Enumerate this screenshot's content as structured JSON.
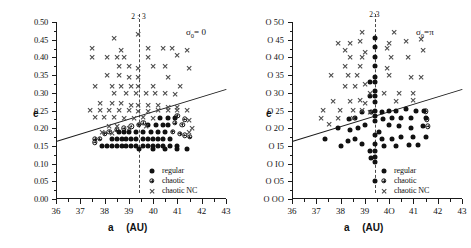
{
  "figure": {
    "panels": [
      {
        "id": "left",
        "annotation": "σ",
        "annotation_sub": "0",
        "annotation_eq": "= 0",
        "resonance_label": "2 : 3",
        "resonance_a": 39.4,
        "xlabel_a": "a",
        "xlabel_unit": "(AU)",
        "ylabel": "e",
        "zero_style": "digit",
        "xticks": [
          "36",
          "37",
          "38",
          "39",
          "40",
          "41",
          "42",
          "43"
        ],
        "yticks": [
          "0.50",
          "0.45",
          "0.40",
          "0.35",
          "0.30",
          "0.25",
          "0.20",
          "0.15",
          "0.10",
          "0.05",
          "0.00"
        ],
        "legend": [
          {
            "marker": "regular",
            "label": "regular"
          },
          {
            "marker": "chaotic",
            "label": "chaotic"
          },
          {
            "marker": "cross",
            "label": "chaotic NC"
          }
        ]
      },
      {
        "id": "right",
        "annotation": "σ",
        "annotation_sub": "0",
        "annotation_eq": "=π",
        "resonance_label": "2:3",
        "resonance_a": 39.4,
        "xlabel_a": "a",
        "xlabel_unit": "(AU)",
        "ylabel": "e",
        "zero_style": "circle",
        "xticks": [
          "36",
          "37",
          "38",
          "39",
          "4O",
          "41",
          "42",
          "43"
        ],
        "yticks": [
          "O 5O",
          "O 45",
          "O 4O",
          "O 35",
          "O 3O",
          "O 25",
          "O 2O",
          "O I5",
          "O IO",
          "O O5",
          "O OO"
        ],
        "legend": [
          {
            "marker": "regular",
            "label": "regular"
          },
          {
            "marker": "chaotic",
            "label": "chaotic"
          },
          {
            "marker": "cross",
            "label": "chaotic NC"
          }
        ]
      }
    ]
  },
  "chart_data": {
    "type": "scatter",
    "title": "",
    "xlabel": "a  (AU)",
    "ylabel": "e",
    "xlim": [
      36,
      43
    ],
    "ylim": [
      0.0,
      0.5
    ],
    "xtick_step": 1,
    "xminor_step": 0.5,
    "ytick_step": 0.05,
    "grid": false,
    "legend_position": "bottom-right",
    "legend_entries": [
      "regular",
      "chaotic",
      "chaotic NC"
    ],
    "annotations": [
      {
        "text": "2 : 3",
        "panel": "left",
        "x": 39.4,
        "y": 0.5
      },
      {
        "text": "σ₀ = 0",
        "panel": "left",
        "x": 42.4,
        "y": 0.465
      },
      {
        "text": "2:3",
        "panel": "right",
        "x": 39.4,
        "y": 0.5
      },
      {
        "text": "σ₀ = π",
        "panel": "right",
        "x": 42.4,
        "y": 0.465
      }
    ],
    "reference_lines": [
      {
        "name": "resonance-2-3",
        "panel": "left",
        "type": "vertical-dashed",
        "x": 39.4
      },
      {
        "name": "resonance-2-3",
        "panel": "right",
        "type": "vertical-dashed",
        "x": 39.4
      },
      {
        "name": "perihelion-boundary",
        "panel": "left",
        "type": "line",
        "x0": 36,
        "y0": 0.165,
        "x1": 43,
        "y1": 0.312
      },
      {
        "name": "perihelion-boundary",
        "panel": "right",
        "type": "line",
        "x0": 36,
        "y0": 0.165,
        "x1": 43,
        "y1": 0.312
      }
    ],
    "series": [
      {
        "name": "regular",
        "panel": "left",
        "marker": "filled-circle",
        "points": [
          [
            37.9,
            0.15
          ],
          [
            38.1,
            0.15
          ],
          [
            38.3,
            0.15
          ],
          [
            38.5,
            0.15
          ],
          [
            38.7,
            0.15
          ],
          [
            38.9,
            0.15
          ],
          [
            39.1,
            0.15
          ],
          [
            39.3,
            0.15
          ],
          [
            39.6,
            0.15
          ],
          [
            39.8,
            0.15
          ],
          [
            40.0,
            0.15
          ],
          [
            40.2,
            0.15
          ],
          [
            40.4,
            0.15
          ],
          [
            40.7,
            0.15
          ],
          [
            41.0,
            0.15
          ],
          [
            41.4,
            0.14
          ],
          [
            39.4,
            0.14
          ],
          [
            40.0,
            0.14
          ],
          [
            40.5,
            0.14
          ],
          [
            41.0,
            0.14
          ],
          [
            38.3,
            0.17
          ],
          [
            38.5,
            0.17
          ],
          [
            38.7,
            0.17
          ],
          [
            38.9,
            0.17
          ],
          [
            39.1,
            0.17
          ],
          [
            39.3,
            0.17
          ],
          [
            39.6,
            0.17
          ],
          [
            39.8,
            0.17
          ],
          [
            40.0,
            0.17
          ],
          [
            40.2,
            0.17
          ],
          [
            40.4,
            0.17
          ],
          [
            40.7,
            0.17
          ],
          [
            38.6,
            0.19
          ],
          [
            38.8,
            0.19
          ],
          [
            39.0,
            0.19
          ],
          [
            39.3,
            0.19
          ],
          [
            39.6,
            0.19
          ],
          [
            39.9,
            0.19
          ],
          [
            40.2,
            0.19
          ],
          [
            40.5,
            0.19
          ],
          [
            39.8,
            0.21
          ],
          [
            40.1,
            0.21
          ],
          [
            40.4,
            0.21
          ],
          [
            40.6,
            0.21
          ],
          [
            40.3,
            0.23
          ],
          [
            40.6,
            0.23
          ],
          [
            40.9,
            0.23
          ]
        ]
      },
      {
        "name": "chaotic",
        "panel": "left",
        "marker": "circled-plus",
        "points": [
          [
            37.6,
            0.16
          ],
          [
            37.6,
            0.17
          ],
          [
            37.8,
            0.17
          ],
          [
            38.0,
            0.185
          ],
          [
            38.2,
            0.19
          ],
          [
            38.5,
            0.195
          ],
          [
            38.8,
            0.2
          ],
          [
            39.1,
            0.205
          ],
          [
            39.4,
            0.21
          ],
          [
            40.8,
            0.19
          ],
          [
            41.1,
            0.185
          ],
          [
            41.3,
            0.18
          ],
          [
            41.5,
            0.175
          ],
          [
            40.9,
            0.215
          ],
          [
            41.2,
            0.21
          ],
          [
            41.0,
            0.235
          ],
          [
            41.3,
            0.225
          ],
          [
            39.6,
            0.215
          ]
        ]
      },
      {
        "name": "chaotic NC",
        "panel": "left",
        "marker": "cross",
        "points": [
          [
            39.4,
            0.465
          ],
          [
            38.4,
            0.455
          ],
          [
            37.5,
            0.425
          ],
          [
            38.7,
            0.42
          ],
          [
            39.8,
            0.425
          ],
          [
            40.4,
            0.425
          ],
          [
            40.8,
            0.425
          ],
          [
            41.4,
            0.42
          ],
          [
            37.5,
            0.4
          ],
          [
            38.1,
            0.4
          ],
          [
            38.5,
            0.4
          ],
          [
            38.8,
            0.4
          ],
          [
            39.8,
            0.4
          ],
          [
            41.0,
            0.405
          ],
          [
            38.6,
            0.375
          ],
          [
            39.0,
            0.375
          ],
          [
            39.4,
            0.37
          ],
          [
            40.0,
            0.375
          ],
          [
            40.5,
            0.375
          ],
          [
            41.5,
            0.37
          ],
          [
            38.1,
            0.35
          ],
          [
            38.6,
            0.35
          ],
          [
            39.0,
            0.345
          ],
          [
            39.4,
            0.345
          ],
          [
            40.6,
            0.345
          ],
          [
            37.6,
            0.32
          ],
          [
            38.3,
            0.32
          ],
          [
            38.7,
            0.32
          ],
          [
            39.1,
            0.32
          ],
          [
            39.4,
            0.32
          ],
          [
            40.0,
            0.32
          ],
          [
            41.1,
            0.32
          ],
          [
            38.4,
            0.3
          ],
          [
            38.9,
            0.3
          ],
          [
            39.3,
            0.3
          ],
          [
            39.7,
            0.3
          ],
          [
            40.1,
            0.3
          ],
          [
            40.5,
            0.3
          ],
          [
            40.9,
            0.295
          ],
          [
            37.8,
            0.27
          ],
          [
            38.3,
            0.27
          ],
          [
            38.7,
            0.27
          ],
          [
            39.1,
            0.265
          ],
          [
            39.4,
            0.265
          ],
          [
            39.8,
            0.265
          ],
          [
            40.2,
            0.265
          ],
          [
            40.6,
            0.26
          ],
          [
            41.0,
            0.26
          ],
          [
            37.4,
            0.25
          ],
          [
            37.8,
            0.25
          ],
          [
            38.2,
            0.25
          ],
          [
            38.6,
            0.25
          ],
          [
            39.0,
            0.25
          ],
          [
            39.4,
            0.248
          ],
          [
            39.8,
            0.248
          ],
          [
            40.2,
            0.25
          ],
          [
            40.6,
            0.25
          ],
          [
            41.0,
            0.25
          ],
          [
            41.4,
            0.25
          ],
          [
            37.6,
            0.23
          ],
          [
            38.0,
            0.23
          ],
          [
            38.4,
            0.23
          ],
          [
            38.8,
            0.228
          ],
          [
            39.2,
            0.228
          ],
          [
            39.6,
            0.23
          ],
          [
            40.0,
            0.228
          ],
          [
            41.5,
            0.222
          ],
          [
            38.2,
            0.205
          ],
          [
            38.5,
            0.205
          ],
          [
            39.0,
            0.2
          ],
          [
            39.7,
            0.205
          ],
          [
            41.6,
            0.2
          ],
          [
            37.9,
            0.188
          ],
          [
            38.3,
            0.185
          ],
          [
            41.5,
            0.19
          ]
        ]
      },
      {
        "name": "regular",
        "panel": "right",
        "marker": "filled-circle",
        "points": [
          [
            39.4,
            0.455
          ],
          [
            39.4,
            0.43
          ],
          [
            39.4,
            0.4
          ],
          [
            39.4,
            0.375
          ],
          [
            39.4,
            0.345
          ],
          [
            39.4,
            0.33
          ],
          [
            39.4,
            0.305
          ],
          [
            39.4,
            0.29
          ],
          [
            39.4,
            0.275
          ],
          [
            39.4,
            0.25
          ],
          [
            39.4,
            0.235
          ],
          [
            39.4,
            0.22
          ],
          [
            39.4,
            0.18
          ],
          [
            39.4,
            0.155
          ],
          [
            39.4,
            0.135
          ],
          [
            39.4,
            0.12
          ],
          [
            39.4,
            0.105
          ],
          [
            39.4,
            0.05
          ],
          [
            39.2,
            0.33
          ],
          [
            39.2,
            0.29
          ],
          [
            39.25,
            0.245
          ],
          [
            39.2,
            0.135
          ],
          [
            39.25,
            0.115
          ],
          [
            38.9,
            0.245
          ],
          [
            38.6,
            0.23
          ],
          [
            38.35,
            0.225
          ],
          [
            39.0,
            0.21
          ],
          [
            38.7,
            0.2
          ],
          [
            38.4,
            0.195
          ],
          [
            37.9,
            0.2
          ],
          [
            37.35,
            0.17
          ],
          [
            38.0,
            0.15
          ],
          [
            38.6,
            0.17
          ],
          [
            38.9,
            0.155
          ],
          [
            38.3,
            0.165
          ],
          [
            39.7,
            0.245
          ],
          [
            40.0,
            0.25
          ],
          [
            40.3,
            0.25
          ],
          [
            40.7,
            0.255
          ],
          [
            41.1,
            0.25
          ],
          [
            41.45,
            0.25
          ],
          [
            39.75,
            0.225
          ],
          [
            40.1,
            0.228
          ],
          [
            40.5,
            0.228
          ],
          [
            40.9,
            0.228
          ],
          [
            41.5,
            0.228
          ],
          [
            39.6,
            0.19
          ],
          [
            40.0,
            0.21
          ],
          [
            40.4,
            0.205
          ],
          [
            40.9,
            0.2
          ],
          [
            41.4,
            0.205
          ],
          [
            39.7,
            0.17
          ],
          [
            40.1,
            0.17
          ],
          [
            40.5,
            0.175
          ],
          [
            41.0,
            0.175
          ],
          [
            41.5,
            0.175
          ],
          [
            39.8,
            0.15
          ],
          [
            40.3,
            0.15
          ],
          [
            40.8,
            0.152
          ],
          [
            41.2,
            0.152
          ]
        ]
      },
      {
        "name": "chaotic",
        "panel": "right",
        "marker": "circled-plus",
        "points": [
          [
            41.5,
            0.248
          ],
          [
            41.55,
            0.225
          ],
          [
            41.6,
            0.205
          ]
        ]
      },
      {
        "name": "chaotic NC",
        "panel": "right",
        "marker": "cross",
        "points": [
          [
            38.9,
            0.47
          ],
          [
            40.2,
            0.47
          ],
          [
            37.9,
            0.44
          ],
          [
            38.4,
            0.44
          ],
          [
            38.8,
            0.445
          ],
          [
            40.0,
            0.44
          ],
          [
            40.7,
            0.445
          ],
          [
            41.3,
            0.45
          ],
          [
            38.2,
            0.42
          ],
          [
            39.0,
            0.415
          ],
          [
            39.9,
            0.425
          ],
          [
            41.4,
            0.42
          ],
          [
            38.4,
            0.4
          ],
          [
            38.9,
            0.4
          ],
          [
            40.1,
            0.4
          ],
          [
            40.8,
            0.4
          ],
          [
            38.2,
            0.375
          ],
          [
            38.8,
            0.375
          ],
          [
            39.9,
            0.37
          ],
          [
            37.6,
            0.35
          ],
          [
            38.3,
            0.35
          ],
          [
            38.7,
            0.35
          ],
          [
            40.0,
            0.35
          ],
          [
            40.9,
            0.345
          ],
          [
            41.3,
            0.345
          ],
          [
            38.2,
            0.32
          ],
          [
            38.6,
            0.32
          ],
          [
            39.0,
            0.325
          ],
          [
            39.2,
            0.3
          ],
          [
            39.8,
            0.3
          ],
          [
            40.4,
            0.3
          ],
          [
            41.0,
            0.3
          ],
          [
            37.7,
            0.275
          ],
          [
            38.4,
            0.275
          ],
          [
            38.8,
            0.28
          ],
          [
            39.0,
            0.27
          ],
          [
            40.3,
            0.275
          ],
          [
            41.0,
            0.28
          ],
          [
            37.3,
            0.25
          ],
          [
            38.0,
            0.25
          ],
          [
            38.5,
            0.25
          ],
          [
            38.9,
            0.25
          ],
          [
            39.2,
            0.245
          ],
          [
            37.2,
            0.228
          ],
          [
            37.9,
            0.228
          ],
          [
            38.5,
            0.228
          ],
          [
            37.55,
            0.21
          ]
        ]
      }
    ]
  }
}
